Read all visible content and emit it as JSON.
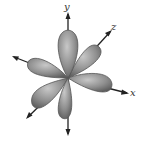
{
  "diagram": {
    "axes": [
      {
        "name": "y",
        "label": "y"
      },
      {
        "name": "z",
        "label": "z"
      },
      {
        "name": "x",
        "label": "x"
      }
    ],
    "colors": {
      "lobe": "#8c8c8c",
      "lobe_edge": "#555555",
      "axis": "#222222"
    }
  }
}
